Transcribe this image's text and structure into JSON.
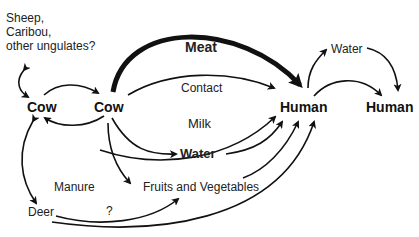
{
  "nodes": {
    "other_hosts": [
      "Sheep,",
      "Caribou,",
      "other ungulates?"
    ],
    "cow1": "Cow",
    "cow2": "Cow",
    "human1": "Human",
    "human2": "Human",
    "deer": "Deer"
  },
  "edges": {
    "meat": "Meat",
    "contact": "Contact",
    "milk": "Milk",
    "water": "Water",
    "fruits": "Fruits and Vegetables",
    "manure": "Manure",
    "unknown": "?",
    "human_water": "Water"
  }
}
